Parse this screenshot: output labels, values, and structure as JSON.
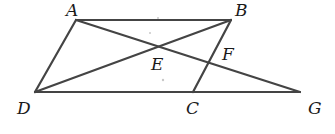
{
  "diagram": {
    "type": "geometry",
    "points": {
      "A": {
        "label": "A",
        "x": 76,
        "y": 20,
        "lx": 66,
        "ly": 16
      },
      "B": {
        "label": "B",
        "x": 231,
        "y": 20,
        "lx": 235,
        "ly": 16
      },
      "C": {
        "label": "C",
        "x": 193,
        "y": 92,
        "lx": 186,
        "ly": 114
      },
      "D": {
        "label": "D",
        "x": 35,
        "y": 92,
        "lx": 17,
        "ly": 114
      },
      "E": {
        "label": "E",
        "x": 157,
        "y": 47,
        "lx": 151,
        "ly": 70
      },
      "F": {
        "label": "F",
        "x": 208,
        "y": 62,
        "lx": 222,
        "ly": 60
      },
      "G": {
        "label": "G",
        "x": 300,
        "y": 92,
        "lx": 308,
        "ly": 114
      }
    },
    "segments": [
      {
        "name": "segment-ab",
        "from": "A",
        "to": "B"
      },
      {
        "name": "segment-ad",
        "from": "A",
        "to": "D"
      },
      {
        "name": "segment-dg",
        "from": "D",
        "to": "G"
      },
      {
        "name": "segment-bc",
        "from": "B",
        "to": "C"
      },
      {
        "name": "segment-ag",
        "from": "A",
        "to": "G"
      },
      {
        "name": "segment-db",
        "from": "D",
        "to": "B"
      }
    ],
    "line_color": "#444444",
    "label_color": "#1a1a1a"
  }
}
